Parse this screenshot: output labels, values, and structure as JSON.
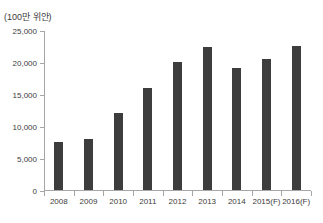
{
  "figure": {
    "background": "#ffffff"
  },
  "chart_data": {
    "type": "bar",
    "unit_label": "(100만 위안)",
    "categories": [
      "2008",
      "2009",
      "2010",
      "2011",
      "2012",
      "2013",
      "2014",
      "2015(F)",
      "2016(F)"
    ],
    "values": [
      7500,
      8000,
      12000,
      16000,
      20000,
      22400,
      19000,
      20500,
      22500
    ],
    "title": "",
    "xlabel": "",
    "ylabel": "",
    "ylim": [
      0,
      25000
    ],
    "ytick_interval": 5000,
    "ytick_labels": [
      "0",
      "5,000",
      "10,000",
      "15,000",
      "20,000",
      "25,000"
    ],
    "grid": false,
    "legend": "none",
    "bar_color": "#3d3d3d",
    "axis_color": "#a6a6a6",
    "text_color": "#3c3c3c"
  }
}
